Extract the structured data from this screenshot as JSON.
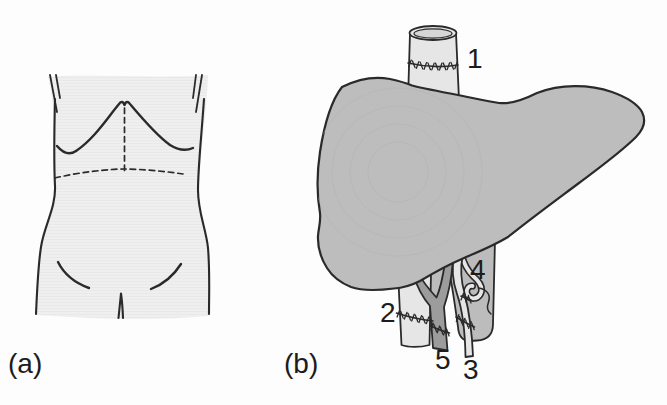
{
  "figure": {
    "panels": {
      "a": {
        "label": "(a)"
      },
      "b": {
        "label": "(b)",
        "annotations": {
          "n1": "1",
          "n2": "2",
          "n3": "3",
          "n4": "4",
          "n5": "5"
        }
      }
    },
    "colors": {
      "background": "#fdfdfd",
      "outline": "#2a2a2a",
      "liver-fill": "#bdbdbd",
      "band-fill": "#bcbcbc",
      "vessel-light": "#e6e6e6",
      "vessel-inner": "#d6d6d6",
      "portal-fill": "#9c9c9c",
      "text": "#1c1c1c"
    }
  }
}
